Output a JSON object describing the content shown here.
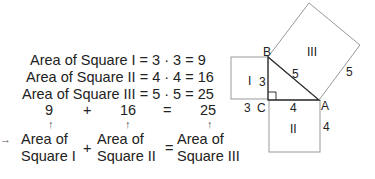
{
  "equations": [
    {
      "text": "Area of Square I = 3 · 3 = 9"
    },
    {
      "text": "Area of Square II = 4 · 4 = 16"
    },
    {
      "text": "Area of Square III = 5 · 5 = 25"
    }
  ],
  "sum_row": {
    "a": "9",
    "plus": "+",
    "b": "16",
    "equals": "=",
    "c": "25"
  },
  "bottom_row": {
    "term1_line1": "Area of",
    "term1_line2": "Square I",
    "plus": "+",
    "term2_line1": "Area of",
    "term2_line2": "Square II",
    "equals": "=",
    "term3_line1": "Area of",
    "term3_line2": "Square III"
  },
  "arrow_glyph": "↑",
  "pointer_glyph": "→",
  "figure": {
    "vertices": {
      "A": "A",
      "B": "B",
      "C": "C"
    },
    "square_labels": {
      "I": "I",
      "II": "II",
      "III": "III"
    },
    "side_labels": {
      "bc": "3",
      "ca": "4",
      "ab": "5",
      "sq1_bottom": "3",
      "sq2_right": "4",
      "sq3_side": "5"
    }
  }
}
